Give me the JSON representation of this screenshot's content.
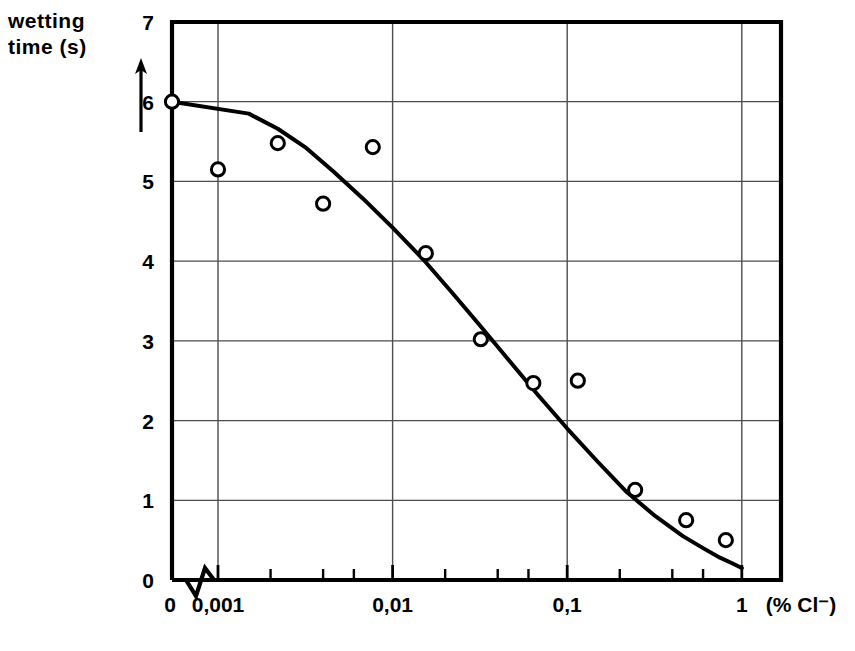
{
  "chart_data": {
    "type": "scatter",
    "title": "",
    "ylabel": "wetting\ntime (s)",
    "ylabel_lines": [
      "wetting",
      "time (s)"
    ],
    "xlabel": "(% Cl⁻)",
    "xscale": "log",
    "yscale": "linear",
    "ylim": [
      0,
      7
    ],
    "xlim": [
      0.001,
      1
    ],
    "grid": true,
    "legend": null,
    "x_axis_break": true,
    "x_break_label": "0",
    "xticks": [
      0.001,
      0.01,
      0.1,
      1
    ],
    "xticklabels": [
      "0,001",
      "0,01",
      "0,1",
      "1"
    ],
    "yticks": [
      0,
      1,
      2,
      3,
      4,
      5,
      6,
      7
    ],
    "yticklabels": [
      "0",
      "1",
      "2",
      "3",
      "4",
      "5",
      "6",
      "7"
    ],
    "points": [
      {
        "x": 0.001,
        "y": 6.0,
        "at_origin": true
      },
      {
        "x": 0.001,
        "y": 5.15
      },
      {
        "x": 0.0022,
        "y": 5.48
      },
      {
        "x": 0.004,
        "y": 4.72
      },
      {
        "x": 0.0077,
        "y": 5.43
      },
      {
        "x": 0.0155,
        "y": 4.1
      },
      {
        "x": 0.032,
        "y": 3.02
      },
      {
        "x": 0.064,
        "y": 2.47
      },
      {
        "x": 0.115,
        "y": 2.5
      },
      {
        "x": 0.245,
        "y": 1.13
      },
      {
        "x": 0.48,
        "y": 0.75
      },
      {
        "x": 0.81,
        "y": 0.5
      }
    ],
    "curve": [
      {
        "x": 0.001,
        "y": 6.0
      },
      {
        "x": 0.0015,
        "y": 5.85
      },
      {
        "x": 0.0022,
        "y": 5.66
      },
      {
        "x": 0.0032,
        "y": 5.42
      },
      {
        "x": 0.0046,
        "y": 5.12
      },
      {
        "x": 0.0068,
        "y": 4.78
      },
      {
        "x": 0.01,
        "y": 4.42
      },
      {
        "x": 0.015,
        "y": 4.02
      },
      {
        "x": 0.022,
        "y": 3.6
      },
      {
        "x": 0.032,
        "y": 3.18
      },
      {
        "x": 0.047,
        "y": 2.74
      },
      {
        "x": 0.068,
        "y": 2.32
      },
      {
        "x": 0.1,
        "y": 1.9
      },
      {
        "x": 0.15,
        "y": 1.48
      },
      {
        "x": 0.22,
        "y": 1.1
      },
      {
        "x": 0.32,
        "y": 0.8
      },
      {
        "x": 0.46,
        "y": 0.55
      },
      {
        "x": 0.6,
        "y": 0.4
      },
      {
        "x": 0.75,
        "y": 0.28
      },
      {
        "x": 0.88,
        "y": 0.21
      },
      {
        "x": 1.0,
        "y": 0.15
      }
    ],
    "marker": "open-circle",
    "colors": {
      "line": "#000000",
      "marker": "#000000",
      "grid": "#4d4d4d",
      "frame": "#000000"
    }
  }
}
